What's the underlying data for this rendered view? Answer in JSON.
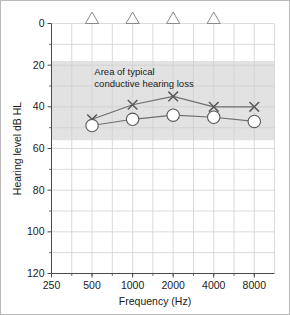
{
  "chart_data": {
    "type": "line",
    "title": "",
    "subtitle": "",
    "xlabel": "Frequency (Hz)",
    "ylabel": "Hearing level dB HL",
    "x_scale": "log2",
    "x_tick_labels": [
      "250",
      "500",
      "1000",
      "2000",
      "4000",
      "8000"
    ],
    "x_tick_values": [
      250,
      500,
      1000,
      2000,
      4000,
      8000
    ],
    "xlim": [
      250,
      11300
    ],
    "y_tick_labels": [
      "0",
      "20",
      "40",
      "60",
      "80",
      "100",
      "120"
    ],
    "y_tick_values": [
      0,
      20,
      40,
      60,
      80,
      100,
      120
    ],
    "y_minor_tick_values": [
      10,
      30,
      50,
      70,
      90,
      110
    ],
    "ylim": [
      0,
      120
    ],
    "y_inverted": true,
    "grid": true,
    "legend_position": "none",
    "annotations": [
      {
        "name": "shaded-band",
        "label_line_1": "Area of typical",
        "label_line_2": "conductive hearing loss",
        "y_from": 18,
        "y_to": 56,
        "x_from": 250,
        "x_to": 11300,
        "color": "#e2e2e2"
      }
    ],
    "series": [
      {
        "name": "Bone conduction (unmasked)",
        "marker": "triangle",
        "line": false,
        "color": "#8a8a8a",
        "x": [
          500,
          1000,
          2000,
          4000
        ],
        "values": [
          0,
          0,
          0,
          0
        ]
      },
      {
        "name": "Air conduction left (X)",
        "marker": "x",
        "line": true,
        "color": "#6e6e6e",
        "x": [
          500,
          1000,
          2000,
          4000,
          8000
        ],
        "values": [
          46,
          39,
          35,
          40,
          40
        ]
      },
      {
        "name": "Air conduction right (O)",
        "marker": "circle",
        "line": true,
        "color": "#6e6e6e",
        "x": [
          500,
          1000,
          2000,
          4000,
          8000
        ],
        "values": [
          49,
          46,
          44,
          45,
          47
        ]
      }
    ]
  },
  "axes": {
    "y_title": "Hearing level dB HL",
    "x_title": "Frequency (Hz)"
  },
  "band": {
    "line1": "Area of typical",
    "line2": "conductive hearing loss"
  },
  "ticks": {
    "y": [
      "0",
      "20",
      "40",
      "60",
      "80",
      "100",
      "120"
    ],
    "x": [
      "250",
      "500",
      "1000",
      "2000",
      "4000",
      "8000"
    ]
  },
  "colors": {
    "grid": "#d0d0d0",
    "axis": "#4a4a4a",
    "band": "#e3e3e3",
    "series_line": "#6f6f6f",
    "marker_stroke": "#5a5a5a",
    "marker_fill": "#ffffff",
    "triangle_stroke": "#9a9a9a",
    "frame": "#b9b9b9",
    "text": "#1a1a1a"
  }
}
